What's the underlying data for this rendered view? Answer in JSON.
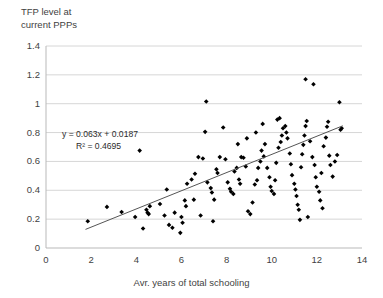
{
  "chart_data": {
    "type": "scatter",
    "title": "TFP level at current PPPs",
    "xlabel": "Avr. years of total schooling",
    "ylabel": "TFP level at current PPPs",
    "xlim": [
      0,
      14
    ],
    "ylim": [
      0,
      1.4
    ],
    "xticks": [
      0,
      2,
      4,
      6,
      8,
      10,
      12,
      14
    ],
    "yticks": [
      0,
      0.2,
      0.4,
      0.6,
      0.8,
      1,
      1.2,
      1.4
    ],
    "xtick_labels": [
      "0",
      "2",
      "4",
      "6",
      "8",
      "10",
      "12",
      "14"
    ],
    "ytick_labels": [
      "0",
      "0.2",
      "0.4",
      "0.6",
      "0.8",
      "1",
      "1.2",
      "1.4"
    ],
    "grid": "horizontal",
    "legend": "none",
    "marker": "diamond",
    "marker_color": "#000000",
    "trendline": {
      "type": "linear",
      "slope": 0.063,
      "intercept": 0.0187,
      "r_squared": 0.4695,
      "equation_label": "y = 0.063x + 0.0187",
      "r2_label": "R² = 0.4695",
      "x_start": 1.75,
      "x_end": 13.15,
      "color": "#555555"
    },
    "points": [
      [
        1.85,
        0.185
      ],
      [
        2.7,
        0.285
      ],
      [
        3.35,
        0.25
      ],
      [
        3.95,
        0.215
      ],
      [
        4.45,
        0.265
      ],
      [
        4.5,
        0.245
      ],
      [
        4.55,
        0.235
      ],
      [
        4.6,
        0.29
      ],
      [
        4.3,
        0.135
      ],
      [
        5.05,
        0.305
      ],
      [
        5.35,
        0.405
      ],
      [
        4.15,
        0.675
      ],
      [
        5.45,
        0.16
      ],
      [
        5.6,
        0.14
      ],
      [
        5.95,
        0.105
      ],
      [
        6.05,
        0.175
      ],
      [
        6.0,
        0.215
      ],
      [
        5.7,
        0.245
      ],
      [
        6.15,
        0.33
      ],
      [
        6.2,
        0.29
      ],
      [
        6.25,
        0.445
      ],
      [
        6.55,
        0.335
      ],
      [
        6.45,
        0.475
      ],
      [
        6.6,
        0.515
      ],
      [
        6.75,
        0.63
      ],
      [
        6.95,
        0.62
      ],
      [
        7.1,
        1.015
      ],
      [
        7.05,
        0.805
      ],
      [
        7.15,
        0.455
      ],
      [
        7.3,
        0.415
      ],
      [
        7.35,
        0.385
      ],
      [
        7.45,
        0.335
      ],
      [
        7.55,
        0.545
      ],
      [
        7.6,
        0.52
      ],
      [
        7.7,
        0.63
      ],
      [
        7.85,
        0.835
      ],
      [
        7.95,
        0.615
      ],
      [
        8.05,
        0.455
      ],
      [
        8.15,
        0.41
      ],
      [
        8.2,
        0.39
      ],
      [
        8.3,
        0.375
      ],
      [
        8.35,
        0.53
      ],
      [
        8.45,
        0.555
      ],
      [
        8.55,
        0.475
      ],
      [
        8.6,
        0.445
      ],
      [
        8.65,
        0.63
      ],
      [
        8.75,
        0.625
      ],
      [
        8.85,
        0.565
      ],
      [
        8.95,
        0.255
      ],
      [
        9.05,
        0.235
      ],
      [
        9.15,
        0.315
      ],
      [
        9.25,
        0.44
      ],
      [
        9.35,
        0.47
      ],
      [
        9.4,
        0.555
      ],
      [
        9.5,
        0.6
      ],
      [
        9.55,
        0.675
      ],
      [
        9.65,
        0.635
      ],
      [
        9.7,
        0.72
      ],
      [
        9.8,
        0.555
      ],
      [
        9.9,
        0.49
      ],
      [
        9.95,
        0.425
      ],
      [
        10.0,
        0.395
      ],
      [
        10.1,
        0.375
      ],
      [
        10.15,
        0.47
      ],
      [
        10.2,
        0.59
      ],
      [
        10.3,
        0.695
      ],
      [
        10.4,
        0.735
      ],
      [
        10.45,
        0.78
      ],
      [
        10.5,
        0.83
      ],
      [
        10.6,
        0.845
      ],
      [
        10.65,
        0.8
      ],
      [
        10.7,
        0.76
      ],
      [
        10.8,
        0.655
      ],
      [
        10.85,
        0.58
      ],
      [
        10.9,
        0.505
      ],
      [
        11.0,
        0.445
      ],
      [
        11.05,
        0.405
      ],
      [
        11.1,
        0.36
      ],
      [
        11.15,
        0.3
      ],
      [
        11.2,
        0.265
      ],
      [
        11.3,
        0.56
      ],
      [
        11.35,
        0.65
      ],
      [
        11.4,
        0.715
      ],
      [
        11.45,
        0.78
      ],
      [
        11.5,
        0.845
      ],
      [
        11.55,
        0.88
      ],
      [
        11.5,
        1.17
      ],
      [
        11.85,
        1.135
      ],
      [
        11.7,
        0.74
      ],
      [
        11.8,
        0.63
      ],
      [
        11.9,
        0.575
      ],
      [
        11.95,
        0.49
      ],
      [
        12.0,
        0.425
      ],
      [
        12.1,
        0.39
      ],
      [
        12.15,
        0.33
      ],
      [
        12.25,
        0.275
      ],
      [
        12.3,
        0.705
      ],
      [
        12.4,
        0.765
      ],
      [
        12.45,
        0.84
      ],
      [
        12.5,
        0.875
      ],
      [
        12.55,
        0.64
      ],
      [
        12.6,
        0.575
      ],
      [
        12.7,
        0.495
      ],
      [
        12.8,
        0.6
      ],
      [
        12.9,
        0.645
      ],
      [
        13.0,
        1.01
      ],
      [
        13.05,
        0.82
      ],
      [
        13.1,
        0.83
      ],
      [
        9.3,
        0.8
      ],
      [
        9.6,
        0.86
      ],
      [
        10.25,
        0.89
      ],
      [
        10.35,
        0.9
      ],
      [
        8.5,
        0.72
      ],
      [
        8.9,
        0.76
      ],
      [
        12.2,
        0.52
      ],
      [
        11.25,
        0.195
      ],
      [
        11.6,
        0.215
      ],
      [
        6.85,
        0.225
      ],
      [
        7.4,
        0.185
      ],
      [
        5.25,
        0.225
      ]
    ]
  }
}
